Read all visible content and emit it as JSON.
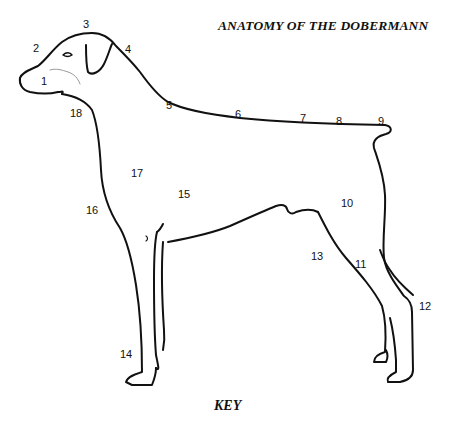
{
  "title": "ANATOMY OF THE DOBERMANN",
  "key_label": "KEY",
  "line_color": "#111111",
  "labels": [
    {
      "n": "1",
      "x": 41,
      "y": 76
    },
    {
      "n": "2",
      "x": 33,
      "y": 43
    },
    {
      "n": "3",
      "x": 83,
      "y": 19
    },
    {
      "n": "4",
      "x": 125,
      "y": 44
    },
    {
      "n": "5",
      "x": 166,
      "y": 100
    },
    {
      "n": "6",
      "x": 235,
      "y": 109
    },
    {
      "n": "7",
      "x": 300,
      "y": 113
    },
    {
      "n": "8",
      "x": 336,
      "y": 116
    },
    {
      "n": "9",
      "x": 378,
      "y": 116
    },
    {
      "n": "10",
      "x": 341,
      "y": 198
    },
    {
      "n": "11",
      "x": 355,
      "y": 259
    },
    {
      "n": "12",
      "x": 419,
      "y": 301
    },
    {
      "n": "13",
      "x": 311,
      "y": 251
    },
    {
      "n": "14",
      "x": 120,
      "y": 349
    },
    {
      "n": "15",
      "x": 178,
      "y": 189
    },
    {
      "n": "16",
      "x": 86,
      "y": 205
    },
    {
      "n": "17",
      "x": 131,
      "y": 168
    },
    {
      "n": "18",
      "x": 70,
      "y": 108
    }
  ]
}
